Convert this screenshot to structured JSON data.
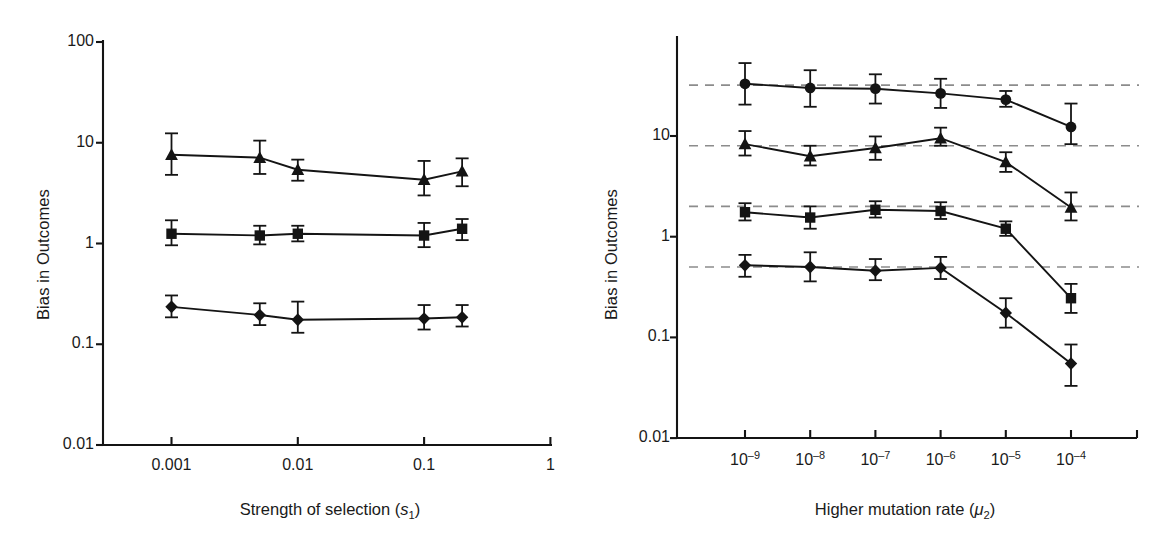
{
  "figure": {
    "background": "#ffffff",
    "ink_color": "#141414",
    "dash_color": "#8c8c8c"
  },
  "panels": [
    {
      "id": "left",
      "axis": {
        "ylabel": "Bias in Outcomes",
        "xlabel_plain": "Strength of selection (s1)",
        "xlabel_prefix": "Strength of selection (",
        "xlabel_var": "s",
        "xlabel_sub": "1",
        "xlabel_suffix": ")",
        "yticks": [
          "0.01",
          "0.1",
          "1",
          "10",
          "100"
        ],
        "ytick_values": [
          0.01,
          0.1,
          1,
          10,
          100
        ],
        "xticks": [
          "0.001",
          "0.01",
          "0.1",
          "1"
        ],
        "xtick_values": [
          0.001,
          0.01,
          0.1,
          1
        ],
        "ylim": [
          0.01,
          100
        ],
        "xlim": [
          0.0005,
          1
        ],
        "grid": "none"
      }
    },
    {
      "id": "right",
      "axis": {
        "ylabel": "Bias in Outcomes",
        "xlabel_plain": "Higher mutation rate (u2)",
        "xlabel_prefix": "Higher mutation rate (",
        "xlabel_var": "μ",
        "xlabel_sub": "2",
        "xlabel_suffix": ")",
        "yticks": [
          "0.01",
          "0.1",
          "1",
          "10"
        ],
        "ytick_values": [
          0.01,
          0.1,
          1,
          10
        ],
        "xticks": [
          "10–9",
          "10–8",
          "10–7",
          "10–6",
          "10–5",
          "10–4"
        ],
        "xtick_exponents": [
          "-9",
          "-8",
          "-7",
          "-6",
          "-5",
          "-4"
        ],
        "xtick_mantissa": "10",
        "ylim": [
          0.01,
          100
        ],
        "xlim": [
          3.2e-10,
          0.00032
        ],
        "grid": "dashed-horizontal"
      }
    }
  ],
  "chart_data": [
    {
      "type": "line",
      "panel": "left",
      "title": "",
      "xlabel": "Strength of selection (s₁)",
      "ylabel": "Bias in Outcomes",
      "xscale": "log",
      "yscale": "log",
      "xlim": [
        0.0005,
        1.0
      ],
      "ylim": [
        0.01,
        100
      ],
      "xticks": [
        0.001,
        0.01,
        0.1,
        1
      ],
      "xticklabels": [
        "0.001",
        "0.01",
        "0.1",
        "1"
      ],
      "yticks": [
        0.01,
        0.1,
        1,
        10,
        100
      ],
      "yticklabels": [
        "0.01",
        "0.1",
        "1",
        "10",
        "100"
      ],
      "grid": false,
      "legend": "none",
      "x": [
        0.001,
        0.005,
        0.01,
        0.1,
        0.2
      ],
      "series": [
        {
          "name": "triangle-series",
          "marker": "triangle",
          "values": [
            7.6,
            7.1,
            5.4,
            4.3,
            5.2
          ],
          "err_low": [
            4.8,
            4.9,
            4.2,
            3.0,
            3.7
          ],
          "err_high": [
            12.4,
            10.5,
            6.8,
            6.6,
            7.0
          ]
        },
        {
          "name": "square-series",
          "marker": "square",
          "values": [
            1.25,
            1.2,
            1.25,
            1.2,
            1.4
          ],
          "err_low": [
            0.96,
            0.98,
            1.05,
            0.92,
            1.08
          ],
          "err_high": [
            1.7,
            1.5,
            1.5,
            1.6,
            1.75
          ]
        },
        {
          "name": "diamond-series",
          "marker": "diamond",
          "values": [
            0.235,
            0.195,
            0.175,
            0.18,
            0.185
          ],
          "err_low": [
            0.185,
            0.155,
            0.13,
            0.14,
            0.15
          ],
          "err_high": [
            0.305,
            0.255,
            0.265,
            0.245,
            0.245
          ]
        }
      ]
    },
    {
      "type": "line",
      "panel": "right",
      "title": "",
      "xlabel": "Higher mutation rate (μ₂)",
      "ylabel": "Bias in Outcomes",
      "xscale": "log",
      "yscale": "log",
      "xlim": [
        3.2e-10,
        0.00032
      ],
      "ylim": [
        0.01,
        100
      ],
      "xticks": [
        1e-09,
        1e-08,
        1e-07,
        1e-06,
        1e-05,
        0.0001
      ],
      "xticklabels": [
        "10⁻⁹",
        "10⁻⁸",
        "10⁻⁷",
        "10⁻⁶",
        "10⁻⁵",
        "10⁻⁴"
      ],
      "yticks": [
        0.01,
        0.1,
        1,
        10
      ],
      "yticklabels": [
        "0.01",
        "0.1",
        "1",
        "10"
      ],
      "grid": false,
      "reference_lines": [
        32,
        8,
        2,
        0.5
      ],
      "reference_line_style": "dashed",
      "legend": "none",
      "x": [
        1e-09,
        1e-08,
        1e-07,
        1e-06,
        1e-05,
        0.0001
      ],
      "series": [
        {
          "name": "circle-series",
          "marker": "circle",
          "values": [
            33.0,
            30.0,
            29.5,
            26.5,
            23.0,
            12.3
          ],
          "err_low": [
            20.5,
            19.5,
            21.0,
            19.0,
            19.5,
            8.3
          ],
          "err_high": [
            53.0,
            45.0,
            41.0,
            37.0,
            28.0,
            21.0
          ]
        },
        {
          "name": "triangle-series",
          "marker": "triangle",
          "values": [
            8.3,
            6.3,
            7.6,
            9.5,
            5.5,
            1.95
          ],
          "err_low": [
            6.4,
            5.1,
            5.8,
            8.0,
            4.4,
            1.45
          ],
          "err_high": [
            11.2,
            8.0,
            9.9,
            12.1,
            6.9,
            2.75
          ]
        },
        {
          "name": "square-series",
          "marker": "square",
          "values": [
            1.75,
            1.55,
            1.85,
            1.8,
            1.2,
            0.245
          ],
          "err_low": [
            1.45,
            1.2,
            1.55,
            1.5,
            1.02,
            0.175
          ],
          "err_high": [
            2.15,
            2.0,
            2.25,
            2.2,
            1.42,
            0.34
          ]
        },
        {
          "name": "diamond-series",
          "marker": "diamond",
          "values": [
            0.52,
            0.5,
            0.46,
            0.49,
            0.175,
            0.055
          ],
          "err_low": [
            0.4,
            0.36,
            0.37,
            0.38,
            0.125,
            0.033
          ],
          "err_high": [
            0.66,
            0.7,
            0.6,
            0.63,
            0.245,
            0.085
          ]
        }
      ]
    }
  ]
}
